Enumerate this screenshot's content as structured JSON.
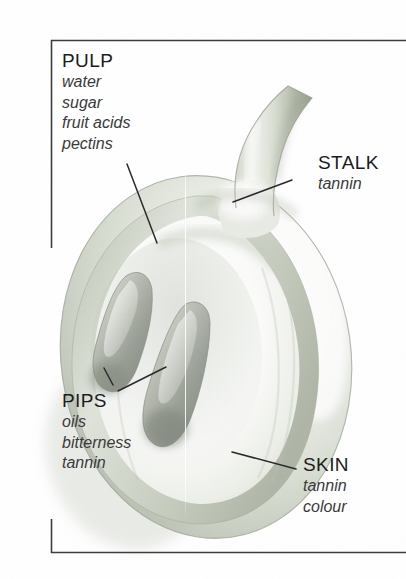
{
  "figure": {
    "background_color": "#ffffff",
    "frame_color": "#3d3d3d",
    "text_color": "#1c1c1c",
    "subtext_color": "#3a3a3a",
    "leader_color": "#2b2b2b"
  },
  "labels": {
    "pulp": {
      "title": "PULP",
      "lines": [
        "water",
        "sugar",
        "fruit acids",
        "pectins"
      ]
    },
    "stalk": {
      "title": "STALK",
      "lines": [
        "tannin"
      ]
    },
    "pips": {
      "title": "PIPS",
      "lines": [
        "oils",
        "bitterness",
        "tannin"
      ]
    },
    "skin": {
      "title": "SKIN",
      "lines": [
        "tannin",
        "colour"
      ]
    }
  },
  "artwork": {
    "grape_body": "cut-away grape berry, pale green-grey pencil shading",
    "stalk": "tapered green-grey stem rising to upper right",
    "pip_upper": "teardrop seed, tapered top, rounded dark base",
    "pip_lower": "teardrop seed, tapered top, rounded dark base",
    "skin_tone": "#cfd3c9",
    "pulp_tone": "#f4f5f1",
    "pip_tone": "#9a9c93",
    "stalk_tone": "#c3c8bb"
  }
}
